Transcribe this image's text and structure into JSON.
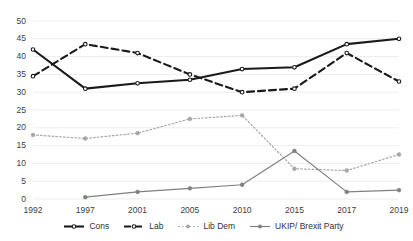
{
  "chart_data": {
    "type": "line",
    "title": "",
    "subtitle": "",
    "xlabel": "",
    "ylabel": "",
    "categories": [
      "1992",
      "1997",
      "2001",
      "2005",
      "2010",
      "2015",
      "2017",
      "2019"
    ],
    "ylim": [
      0,
      50
    ],
    "yticks": [
      "0",
      "5",
      "10",
      "15",
      "20",
      "25",
      "30",
      "35",
      "40",
      "45",
      "50"
    ],
    "grid": true,
    "legend_position": "bottom",
    "series": [
      {
        "name": "Cons",
        "values": [
          42,
          31,
          32.5,
          33.5,
          36.5,
          37,
          43.5,
          45
        ],
        "color": "#1a1a1a",
        "style": "solid",
        "marker": "circle-open"
      },
      {
        "name": "Lab",
        "values": [
          34.5,
          43.5,
          41,
          35,
          30,
          31,
          41,
          33
        ],
        "color": "#1a1a1a",
        "style": "dashed",
        "marker": "circle-open"
      },
      {
        "name": "Lib Dem",
        "values": [
          18,
          17,
          18.5,
          22.5,
          23.5,
          8.5,
          8,
          12.5
        ],
        "color": "#a6a6a6",
        "style": "dotted",
        "marker": "circle-filled"
      },
      {
        "name": "UKIP/ Brexit Party",
        "values": [
          null,
          0.5,
          2,
          3,
          4,
          13.5,
          2,
          2.5
        ],
        "color": "#808080",
        "style": "solid",
        "marker": "circle-filled"
      }
    ]
  },
  "legend": {
    "items": [
      {
        "label": "Cons"
      },
      {
        "label": "Lab"
      },
      {
        "label": "Lib Dem"
      },
      {
        "label": "UKIP/ Brexit Party"
      }
    ]
  }
}
